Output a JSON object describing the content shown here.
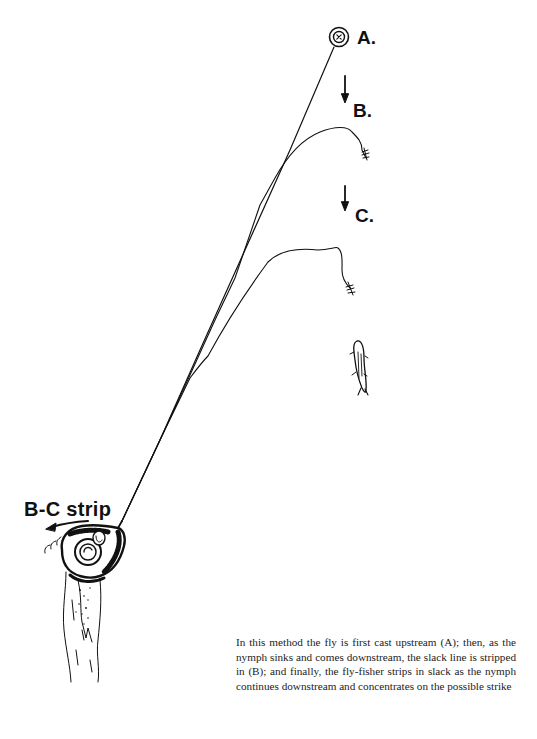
{
  "diagram": {
    "labels": {
      "a": "A.",
      "b": "B.",
      "c": "C.",
      "strip": "B-C strip"
    },
    "caption": "In this method the fly is first cast upstream (A); then, as the nymph sinks and comes downstream, the slack line is stripped in (B); and finally, the fly-fisher strips in slack as the nymph continues downstream and concentrates on the possible strike",
    "elements": [
      {
        "id": "fly-landing-target",
        "position": "A",
        "icon": "target-circle-icon"
      },
      {
        "id": "downstream-arrow-1",
        "icon": "arrow-down-icon"
      },
      {
        "id": "fly-position-b",
        "icon": "nymph-fly-icon"
      },
      {
        "id": "downstream-arrow-2",
        "icon": "arrow-down-icon"
      },
      {
        "id": "fly-position-c",
        "icon": "nymph-fly-icon"
      },
      {
        "id": "trout",
        "icon": "fish-icon"
      },
      {
        "id": "fly-reel-hand",
        "icon": "reel-icon"
      },
      {
        "id": "strip-direction-arrow",
        "icon": "arrow-left-icon"
      }
    ],
    "colors": {
      "ink": "#111111",
      "paper": "#ffffff",
      "caption_text": "#222222"
    }
  }
}
